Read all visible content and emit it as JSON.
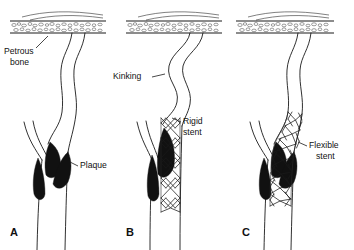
{
  "figure": {
    "background_color": "#ffffff",
    "ink_color": "#111111",
    "plaque_color": "#111111",
    "width": 354,
    "height": 250
  },
  "panels": [
    {
      "id": "A",
      "letter": "A",
      "letter_x": 10,
      "letter_y": 233,
      "caption": "Native carotid bifurcation with atherosclerotic plaque and mild tortuosity below the petrous bone",
      "annotations": [
        {
          "key": "petrous_bone",
          "name": "petrous-bone-label",
          "line1": "Petrous",
          "line2": "bone",
          "text_x": 4,
          "text_y1": 52,
          "text_y2": 63,
          "leader": "M 36 48 L 48 36"
        },
        {
          "key": "plaque",
          "name": "plaque-label",
          "line1": "Plaque",
          "line2": "",
          "text_x": 80,
          "text_y1": 165,
          "text_y2": 0,
          "leader": "M 78 165 L 70 162"
        }
      ]
    },
    {
      "id": "B",
      "letter": "B",
      "letter_x": 126,
      "letter_y": 233,
      "caption": "Rigid stent straightens the stented segment and produces kinking of the artery above the stent",
      "annotations": [
        {
          "key": "kinking",
          "name": "kinking-label",
          "line1": "Kinking",
          "line2": "",
          "text_x": 115,
          "text_y1": 77,
          "text_y2": 0,
          "leader": "M 152 77 L 163 74"
        },
        {
          "key": "rigid_stent",
          "name": "rigid-stent-label",
          "line1": "Rigid",
          "line2": "stent",
          "text_x": 180,
          "text_y1": 122,
          "text_y2": 132,
          "leader": "M 178 122 L 168 119"
        }
      ]
    },
    {
      "id": "C",
      "letter": "C",
      "letter_x": 242,
      "letter_y": 233,
      "caption": "Flexible stent conforms to the natural curvature of the artery without kinking",
      "annotations": [
        {
          "key": "flexible_stent",
          "name": "flexible-stent-label",
          "line1": "Flexible",
          "line2": "stent",
          "text_x": 310,
          "text_y1": 145,
          "text_y2": 155,
          "leader": "M 308 145 L 299 142"
        }
      ]
    }
  ],
  "legend_terms": {
    "petrous_bone": "Petrous bone",
    "plaque": "Plaque",
    "kinking": "Kinking",
    "rigid_stent": "Rigid stent",
    "flexible_stent": "Flexible stent"
  },
  "anatomy": {
    "bone_band_top_y": 21,
    "bone_band_bottom_y": 33,
    "vessel_label": "internal carotid artery",
    "branch_label": "external carotid artery",
    "trunk_label": "common carotid artery"
  }
}
